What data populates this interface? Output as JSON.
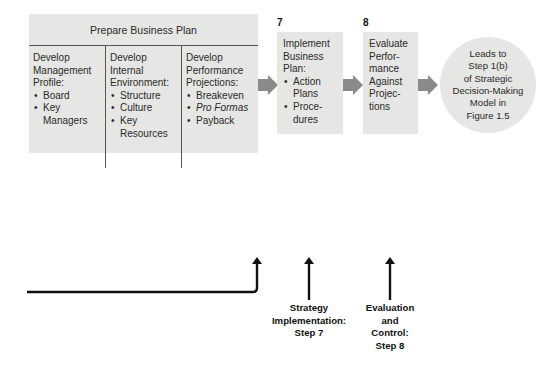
{
  "plan": {
    "title": "Prepare Business Plan",
    "columns": [
      {
        "title_lines": [
          "Develop",
          "Management",
          "Profile:"
        ],
        "items": [
          {
            "lines": [
              "Board"
            ],
            "italic": false
          },
          {
            "lines": [
              "Key",
              "Managers"
            ],
            "italic": false
          }
        ]
      },
      {
        "title_lines": [
          "Develop",
          "Internal",
          "Environment:"
        ],
        "items": [
          {
            "lines": [
              "Structure"
            ],
            "italic": false
          },
          {
            "lines": [
              "Culture"
            ],
            "italic": false
          },
          {
            "lines": [
              "Key",
              "Resources"
            ],
            "italic": false
          }
        ]
      },
      {
        "title_lines": [
          "Develop",
          "Performance",
          "Projections:"
        ],
        "items": [
          {
            "lines": [
              "Breakeven"
            ],
            "italic": false
          },
          {
            "lines": [
              "Pro Formas"
            ],
            "italic": true
          },
          {
            "lines": [
              "Payback"
            ],
            "italic": false
          }
        ]
      }
    ]
  },
  "step7": {
    "number": "7",
    "title_lines": [
      "Implement",
      "Business",
      "Plan:"
    ],
    "items": [
      {
        "lines": [
          "Action",
          "Plans"
        ]
      },
      {
        "lines": [
          "Proce-",
          "dures"
        ]
      }
    ]
  },
  "step8": {
    "number": "8",
    "lines": [
      "Evaluate",
      "Perfor-",
      "mance",
      "Against",
      "Projec-",
      "tions"
    ]
  },
  "circle": {
    "lines": [
      "Leads to",
      "Step 1(b)",
      "of Strategic",
      "Decision-Making",
      "Model in",
      "Figure 1.5"
    ]
  },
  "bottom_labels": {
    "implementation": [
      "Strategy",
      "Implementation:",
      "Step 7"
    ],
    "evaluation": [
      "Evaluation",
      "and",
      "Control:",
      "Step 8"
    ]
  },
  "colors": {
    "box_fill": "#e6e6e4",
    "divider": "#555555",
    "flow_arrow": "#8a8a8a",
    "line_arrow": "#111111"
  }
}
